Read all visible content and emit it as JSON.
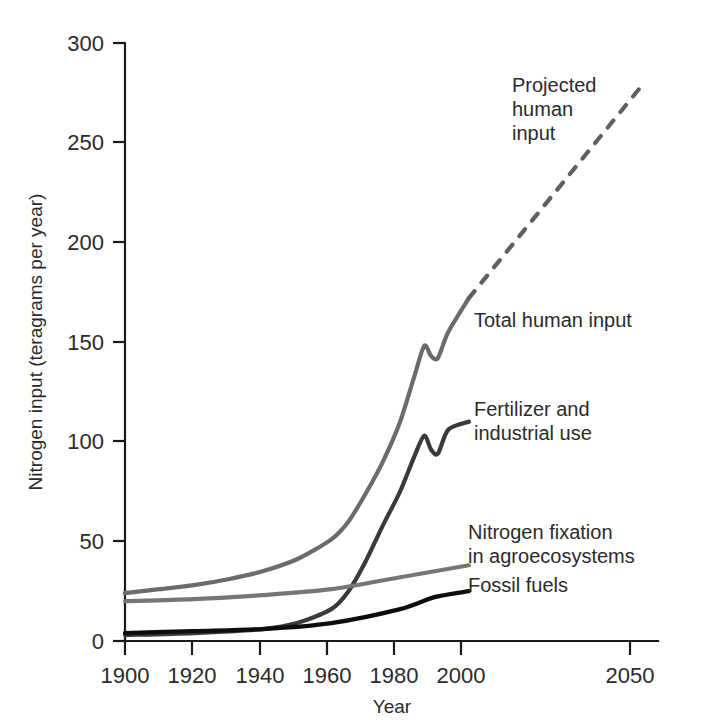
{
  "chart_data": {
    "type": "line",
    "title": "",
    "xlabel": "Year",
    "ylabel": "Nitrogen input (teragrams per year)",
    "xlim": [
      1900,
      2055
    ],
    "ylim": [
      0,
      300
    ],
    "xticks": [
      1900,
      1920,
      1940,
      1960,
      1980,
      2000,
      2050
    ],
    "xtick_labels": [
      "1900",
      "1920",
      "1940",
      "1960",
      "1980",
      "2000",
      "2050"
    ],
    "yticks": [
      0,
      50,
      100,
      150,
      200,
      250,
      300
    ],
    "ytick_labels": [
      "0",
      "50",
      "100",
      "150",
      "200",
      "250",
      "300"
    ],
    "grid": false,
    "legend_position": "inline-annotations",
    "series": [
      {
        "name": "Total human input",
        "label": "Total human input",
        "color": "#6b6b6b",
        "style": "solid",
        "width": 4.2,
        "x": [
          1900,
          1910,
          1920,
          1930,
          1940,
          1950,
          1960,
          1965,
          1970,
          1975,
          1980,
          1984,
          1987,
          1989,
          1991,
          1994,
          2000
        ],
        "y": [
          24,
          26,
          28,
          31,
          35,
          41,
          51,
          60,
          74,
          90,
          110,
          132,
          148,
          143,
          142,
          155,
          172
        ]
      },
      {
        "name": "Fertilizer and industrial use",
        "label": "Fertilizer and industrial use",
        "color": "#3a3a3a",
        "style": "solid",
        "width": 4.2,
        "x": [
          1900,
          1920,
          1940,
          1950,
          1960,
          1965,
          1970,
          1975,
          1980,
          1984,
          1987,
          1989,
          1991,
          1994,
          2000
        ],
        "y": [
          3,
          4,
          6,
          9,
          16,
          25,
          40,
          58,
          75,
          92,
          103,
          96,
          94,
          106,
          110
        ]
      },
      {
        "name": "Nitrogen fixation in agroecosystems",
        "label": "Nitrogen fixation in agroecosystems",
        "color": "#767676",
        "style": "solid",
        "width": 4.2,
        "x": [
          1900,
          1920,
          1940,
          1960,
          1980,
          2000
        ],
        "y": [
          20,
          21,
          23,
          26,
          32,
          38
        ]
      },
      {
        "name": "Fossil fuels",
        "label": "Fossil fuels",
        "color": "#0d0d0d",
        "style": "solid",
        "width": 4.2,
        "x": [
          1900,
          1920,
          1940,
          1960,
          1980,
          1990,
          2000
        ],
        "y": [
          4,
          5,
          6,
          9,
          16,
          22,
          25
        ]
      },
      {
        "name": "Projected human input",
        "label": "Projected human input",
        "color": "#5f5f5f",
        "style": "dashed",
        "width": 4.2,
        "x": [
          2000,
          2050
        ],
        "y": [
          172,
          278
        ]
      }
    ],
    "annotations": [
      {
        "text": "Projected human input",
        "lines": [
          "Projected",
          "human",
          "input"
        ],
        "x": 2017,
        "y": 270
      },
      {
        "text": "Total human input",
        "lines": [
          "Total human input"
        ],
        "x": 2004,
        "y": 163
      },
      {
        "text": "Fertilizer and industrial use",
        "lines": [
          "Fertilizer and",
          "industrial use"
        ],
        "x": 2004,
        "y": 113
      },
      {
        "text": "Nitrogen fixation in agroecosystems",
        "lines": [
          "Nitrogen fixation",
          "in agroecosystems"
        ],
        "x": 2001,
        "y": 55
      },
      {
        "text": "Fossil fuels",
        "lines": [
          "Fossil fuels"
        ],
        "x": 2001,
        "y": 25
      }
    ]
  },
  "axes": {
    "x_title": "Year",
    "y_title": "Nitrogen input (teragrams per year)"
  }
}
